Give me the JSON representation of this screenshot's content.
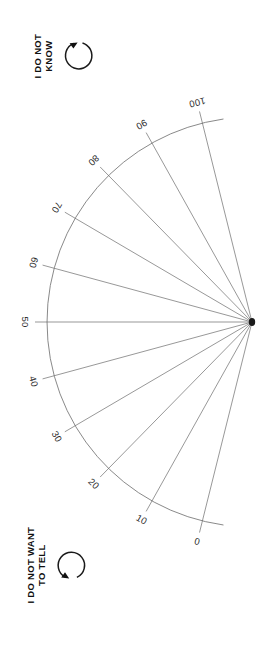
{
  "figure": {
    "name": "visual-analog-scale-fan",
    "background_color": "#ffffff",
    "line_color": "#6b6b6b",
    "hub_color": "#1a1a1a",
    "text_color": "#111111"
  },
  "scale": {
    "type": "radial-fan-scale",
    "orientation": "opens-left",
    "hub": {
      "x": 252,
      "y": 322
    },
    "radius": 205,
    "spoke_overshoot": 12,
    "start_angle_deg": 104,
    "end_angle_deg": 256,
    "ticks": [
      {
        "value": "0",
        "angle_deg": 256
      },
      {
        "value": "10",
        "angle_deg": 240.8
      },
      {
        "value": "20",
        "angle_deg": 225.6
      },
      {
        "value": "30",
        "angle_deg": 210.4
      },
      {
        "value": "40",
        "angle_deg": 195.2
      },
      {
        "value": "50",
        "angle_deg": 180
      },
      {
        "value": "60",
        "angle_deg": 164.8
      },
      {
        "value": "70",
        "angle_deg": 149.6
      },
      {
        "value": "80",
        "angle_deg": 134.4
      },
      {
        "value": "90",
        "angle_deg": 119.2
      },
      {
        "value": "100",
        "angle_deg": 104
      }
    ]
  },
  "options": {
    "do_not_know": {
      "label": "I DO NOT\nKNOW",
      "icon": "circular-arrow-clockwise-icon"
    },
    "do_not_want_to_tell": {
      "label": "I DO NOT WANT\nTO TELL",
      "icon": "circular-arrow-counterclockwise-icon"
    }
  },
  "chart_data": {
    "type": "scatter",
    "title": "",
    "subtitle": "",
    "xlabel": "",
    "ylabel": "",
    "categories": [
      "0",
      "10",
      "20",
      "30",
      "40",
      "50",
      "60",
      "70",
      "80",
      "90",
      "100"
    ],
    "values": [
      0,
      10,
      20,
      30,
      40,
      50,
      60,
      70,
      80,
      90,
      100
    ],
    "ylim": [
      0,
      100
    ],
    "grid": false,
    "legend": "none",
    "annotations": [
      "I DO NOT KNOW",
      "I DO NOT WANT TO TELL"
    ]
  }
}
